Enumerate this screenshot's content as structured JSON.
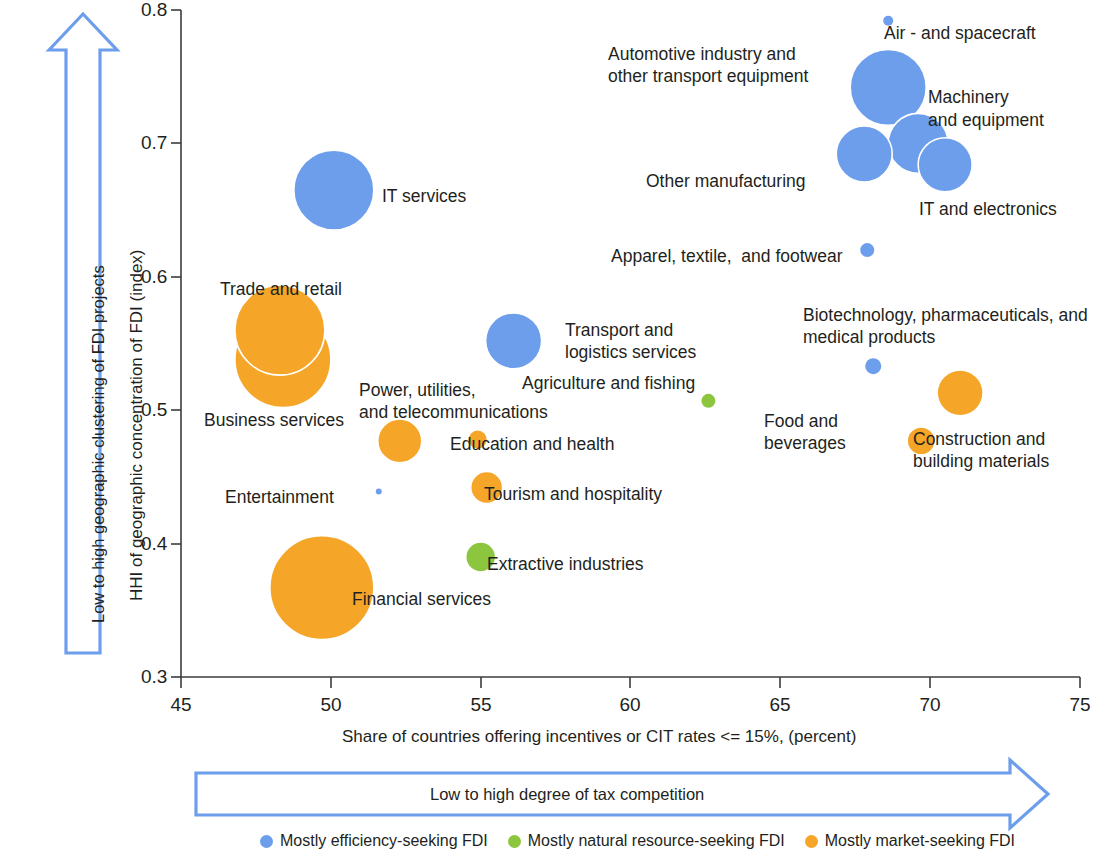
{
  "chart_data": {
    "type": "scatter",
    "title": "",
    "xlabel": "Share of countries offering incentives or CIT rates <= 15%, (percent)",
    "ylabel": "HHI of geographic concentration of FDI (index)",
    "xlim": [
      45,
      75
    ],
    "ylim": [
      0.3,
      0.8
    ],
    "xticks": [
      "45",
      "50",
      "55",
      "60",
      "65",
      "70",
      "75"
    ],
    "yticks": [
      "0.8",
      "0.7",
      "0.6",
      "0.5",
      "0.4",
      "0.3"
    ],
    "grid": false,
    "bubble_size_meaning": "FDI project volume (relative bubble area)",
    "x_arrow_caption": "Low to high degree of tax competition",
    "y_arrow_caption": "Low to high geographic clustering of FDI projects",
    "categories": {
      "efficiency": "Mostly efficiency-seeking FDI",
      "natural_resource": "Mostly natural resource-seeking FDI",
      "market": "Mostly market-seeking FDI"
    },
    "colors": {
      "efficiency": "#6d9eeb",
      "natural_resource": "#8cc63f",
      "market": "#f5a629",
      "arrow_stroke": "#6d9eeb",
      "axis": "#3c3c3c",
      "text": "#231f20"
    },
    "points": [
      {
        "label": "Air - and spacecraft",
        "x": 68.6,
        "y": 0.792,
        "r": 5,
        "group": "efficiency",
        "label_pos": "right"
      },
      {
        "label": "Automotive industry and\nother transport equipment",
        "x": 68.6,
        "y": 0.742,
        "r": 38,
        "group": "efficiency",
        "label_pos": "left"
      },
      {
        "label": "Machinery\nand equipment",
        "x": 69.6,
        "y": 0.7,
        "r": 30,
        "group": "efficiency",
        "label_pos": "right"
      },
      {
        "label": "Other manufacturing",
        "x": 67.8,
        "y": 0.692,
        "r": 28,
        "group": "efficiency",
        "label_pos": "left"
      },
      {
        "label": "IT and electronics",
        "x": 70.5,
        "y": 0.684,
        "r": 27,
        "group": "efficiency",
        "label_pos": "below-right"
      },
      {
        "label": "IT services",
        "x": 50.1,
        "y": 0.665,
        "r": 40,
        "group": "efficiency",
        "label_pos": "right"
      },
      {
        "label": "Apparel, textile,  and footwear",
        "x": 67.9,
        "y": 0.62,
        "r": 7,
        "group": "efficiency",
        "label_pos": "left"
      },
      {
        "label": "Trade and retail",
        "x": 48.3,
        "y": 0.56,
        "r": 45,
        "group": "market",
        "label_pos": "above"
      },
      {
        "label": "Business services",
        "x": 48.4,
        "y": 0.538,
        "r": 48,
        "group": "market",
        "label_pos": "below-left"
      },
      {
        "label": "Transport and\nlogistics services",
        "x": 56.1,
        "y": 0.552,
        "r": 28,
        "group": "efficiency",
        "label_pos": "right"
      },
      {
        "label": "Biotechnology, pharmaceuticals, and\nmedical products",
        "x": 68.1,
        "y": 0.533,
        "r": 8,
        "group": "efficiency",
        "label_pos": "above"
      },
      {
        "label": "Construction and\nbuilding materials",
        "x": 71.0,
        "y": 0.513,
        "r": 23,
        "group": "market",
        "label_pos": "below-right"
      },
      {
        "label": "Agriculture and fishing",
        "x": 62.6,
        "y": 0.507,
        "r": 7,
        "group": "natural_resource",
        "label_pos": "left"
      },
      {
        "label": "Power, utilities,\nand telecommunications",
        "x": 52.3,
        "y": 0.477,
        "r": 22,
        "group": "market",
        "label_pos": "above"
      },
      {
        "label": "Education and health",
        "x": 54.9,
        "y": 0.478,
        "r": 9,
        "group": "market",
        "label_pos": "right"
      },
      {
        "label": "Food and\nbeverages",
        "x": 69.7,
        "y": 0.477,
        "r": 14,
        "group": "market",
        "label_pos": "left"
      },
      {
        "label": "Entertainment",
        "x": 51.6,
        "y": 0.439,
        "r": 3,
        "group": "efficiency",
        "label_pos": "left"
      },
      {
        "label": "Tourism and hospitality",
        "x": 55.2,
        "y": 0.442,
        "r": 16,
        "group": "market",
        "label_pos": "right"
      },
      {
        "label": "Extractive industries",
        "x": 55.0,
        "y": 0.39,
        "r": 15,
        "group": "natural_resource",
        "label_pos": "right"
      },
      {
        "label": "Financial services",
        "x": 49.7,
        "y": 0.367,
        "r": 52,
        "group": "market",
        "label_pos": "right"
      }
    ]
  },
  "axis": {
    "x_title": "Share of countries offering incentives or CIT rates <= 15%, (percent)",
    "y_title": "HHI of geographic concentration of FDI (index)",
    "x_ticks": [
      "45",
      "50",
      "55",
      "60",
      "65",
      "70",
      "75"
    ],
    "y_ticks": [
      "0.8",
      "0.7",
      "0.6",
      "0.5",
      "0.4",
      "0.3"
    ]
  },
  "arrows": {
    "vertical_caption": "Low to high geographic clustering of FDI projects",
    "horizontal_caption": "Low to high degree of tax competition"
  },
  "legend": {
    "items": [
      {
        "label": "Mostly efficiency-seeking FDI",
        "color": "#6d9eeb"
      },
      {
        "label": "Mostly natural resource-seeking FDI",
        "color": "#8cc63f"
      },
      {
        "label": "Mostly market-seeking FDI",
        "color": "#f5a629"
      }
    ]
  },
  "labels": {
    "air_spacecraft": "Air - and spacecraft",
    "automotive_l1": "Automotive industry and",
    "automotive_l2": "other transport equipment",
    "machinery_l1": "Machinery",
    "machinery_l2": "and equipment",
    "other_manufacturing": "Other manufacturing",
    "it_electronics": "IT and electronics",
    "it_services": "IT services",
    "apparel": "Apparel, textile,  and footwear",
    "trade_retail": "Trade and retail",
    "business_services": "Business services",
    "transport_l1": "Transport and",
    "transport_l2": "logistics services",
    "biotech_l1": "Biotechnology, pharmaceuticals, and",
    "biotech_l2": "medical products",
    "construction_l1": "Construction and",
    "construction_l2": "building materials",
    "agriculture": "Agriculture and fishing",
    "power_l1": "Power, utilities,",
    "power_l2": "and telecommunications",
    "education_health": "Education and health",
    "food_l1": "Food and",
    "food_l2": "beverages",
    "entertainment": "Entertainment",
    "tourism": "Tourism and hospitality",
    "extractive": "Extractive industries",
    "financial": "Financial services"
  }
}
